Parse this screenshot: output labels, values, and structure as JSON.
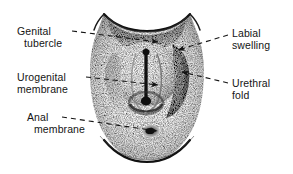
{
  "figure": {
    "background_color": "#ffffff",
    "ink_color": "#141414",
    "width": 293,
    "height": 174
  },
  "labels": {
    "genital_tubercle": {
      "line1": "Genital",
      "line2": "tubercle"
    },
    "urogenital_membrane": {
      "line1": "Urogenital",
      "line2": "membrane"
    },
    "anal_membrane": {
      "line1": "Anal",
      "line2": "membrane"
    },
    "labial_swelling": {
      "line1": "Labial",
      "line2": "swelling"
    },
    "urethral_fold": {
      "line1": "Urethral",
      "line2": "fold"
    }
  },
  "structures": [
    {
      "name": "genital-tubercle",
      "side": "left",
      "leader": "dashed-with-arrowhead"
    },
    {
      "name": "urogenital-membrane",
      "side": "left",
      "leader": "dashed-with-arrowhead"
    },
    {
      "name": "anal-membrane",
      "side": "left",
      "leader": "dashed-with-arrowhead"
    },
    {
      "name": "labial-swelling",
      "side": "right",
      "leader": "dashed-with-arrowhead"
    },
    {
      "name": "urethral-fold",
      "side": "right",
      "leader": "dashed-with-arrowhead"
    }
  ]
}
